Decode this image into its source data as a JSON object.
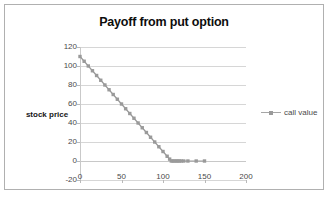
{
  "chart_data": {
    "type": "line",
    "title": "Payoff from put option",
    "xlabel": "",
    "ylabel": "stock price",
    "xlim": [
      0,
      200
    ],
    "ylim": [
      -20,
      120
    ],
    "xticks": [
      0,
      50,
      100,
      150,
      200
    ],
    "yticks": [
      -20,
      0,
      20,
      40,
      60,
      80,
      100,
      120
    ],
    "grid": true,
    "legend_position": "right",
    "series": [
      {
        "name": "call value",
        "marker": "square",
        "color": "#9a9a9a",
        "x": [
          0,
          5,
          10,
          15,
          20,
          25,
          30,
          35,
          40,
          45,
          50,
          55,
          60,
          65,
          70,
          75,
          80,
          85,
          90,
          95,
          100,
          105,
          108,
          110,
          112,
          114,
          116,
          118,
          120,
          122,
          125,
          130,
          140,
          150
        ],
        "y": [
          110,
          105,
          100,
          95,
          90,
          85,
          80,
          75,
          70,
          65,
          60,
          55,
          50,
          45,
          40,
          35,
          30,
          25,
          20,
          15,
          10,
          5,
          2,
          0,
          0,
          0,
          0,
          0,
          0,
          0,
          0,
          0,
          0,
          0
        ]
      }
    ]
  },
  "legend": {
    "entries": [
      {
        "label": "call value"
      }
    ]
  },
  "axis_titles": {
    "y": "stock price"
  },
  "colors": {
    "series": "#9a9a9a",
    "grid": "#d6d6d6",
    "axis": "#c9c9c9",
    "border": "#b0b0b0",
    "tick_text": "#4a4a4a",
    "title_text": "#0d0d0d"
  }
}
